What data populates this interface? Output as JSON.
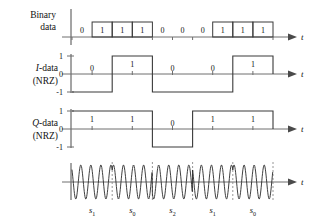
{
  "figure": {
    "axis_name": "t",
    "background_color": "#ffffff",
    "line_color": "#3a3a3a",
    "axis_color": "#6e6e6e"
  },
  "rows": {
    "binary": {
      "label_line1": "Binary",
      "label_line2": "data",
      "bits": [
        "0",
        "1",
        "1",
        "1",
        "0",
        "0",
        "0",
        "1",
        "1",
        "1"
      ],
      "boxed_value": "1"
    },
    "idata": {
      "label_line1": "I-data",
      "label_line1_italic": "I",
      "label_line1_rest": "-data",
      "label_line2": "(NRZ)",
      "tick_labels": [
        "1",
        "0",
        "-1"
      ],
      "symbols": [
        "0",
        "1",
        "0",
        "0",
        "1"
      ],
      "levels": [
        -1,
        1,
        -1,
        -1,
        1
      ]
    },
    "qdata": {
      "label_line1": "Q-data",
      "label_line1_italic": "Q",
      "label_line1_rest": "-data",
      "label_line2": "(NRZ)",
      "tick_labels": [
        "1",
        "0",
        "-1"
      ],
      "symbols": [
        "1",
        "1",
        "0",
        "1",
        "1"
      ],
      "levels": [
        1,
        1,
        -1,
        1,
        1
      ]
    },
    "carrier": {
      "symbol_labels": [
        {
          "base": "s",
          "sub": "1"
        },
        {
          "base": "s",
          "sub": "0"
        },
        {
          "base": "s",
          "sub": "2"
        },
        {
          "base": "s",
          "sub": "1"
        },
        {
          "base": "s",
          "sub": "0"
        }
      ]
    }
  },
  "chart_data": {
    "type": "line",
    "xlabel": "t",
    "bit_count": 10,
    "symbol_count": 5,
    "binary_sequence": [
      "0",
      "1",
      "1",
      "1",
      "0",
      "0",
      "0",
      "1",
      "1",
      "1"
    ],
    "i_channel": {
      "bits": [
        "0",
        "1",
        "0",
        "0",
        "1"
      ],
      "levels": [
        -1,
        1,
        -1,
        -1,
        1
      ]
    },
    "q_channel": {
      "bits": [
        "1",
        "1",
        "0",
        "1",
        "1"
      ],
      "levels": [
        1,
        1,
        -1,
        1,
        1
      ]
    },
    "symbols": [
      "s1",
      "s0",
      "s2",
      "s1",
      "s0"
    ],
    "carrier_cycles_per_symbol": 4
  }
}
